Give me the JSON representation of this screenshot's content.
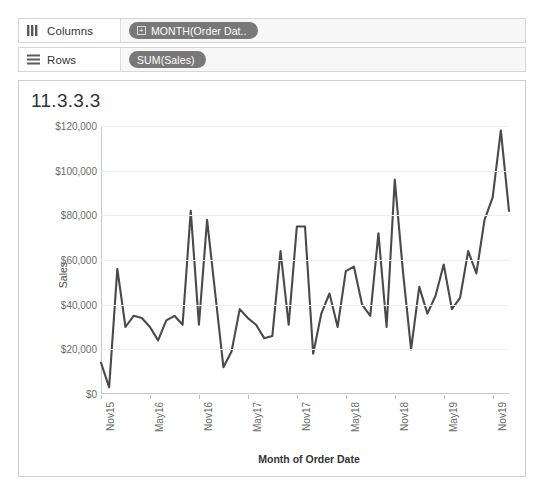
{
  "shelves": [
    {
      "name": "columns",
      "label": "Columns",
      "icon": "columns-icon",
      "pills": [
        {
          "label": "MONTH(Order Dat..",
          "expand": "+",
          "has_expand": true
        }
      ]
    },
    {
      "name": "rows",
      "label": "Rows",
      "icon": "rows-icon",
      "pills": [
        {
          "label": "SUM(Sales)",
          "expand": "",
          "has_expand": false
        }
      ]
    }
  ],
  "view": {
    "title": "11.3.3.3"
  },
  "colors": {
    "line": "#4a4a4a",
    "pill": "#787878",
    "grid": "#ededed",
    "axis": "#c8c8c8",
    "tick_text": "#6b6b6b",
    "panel_border": "#cfcfcf"
  },
  "chart_data": {
    "type": "line",
    "title": "11.3.3.3",
    "xlabel": "Month of Order Date",
    "ylabel": "Sales",
    "ylim": [
      0,
      120000
    ],
    "ytick_values": [
      0,
      20000,
      40000,
      60000,
      80000,
      100000,
      120000
    ],
    "ytick_labels": [
      "$0",
      "$20,000",
      "$40,000",
      "$60,000",
      "$80,000",
      "$100,000",
      "$120,000"
    ],
    "xtick_labels": [
      "Nov15",
      "May16",
      "Nov16",
      "May17",
      "Nov17",
      "May18",
      "Nov18",
      "May19",
      "Nov19"
    ],
    "xtick_indices": [
      0,
      6,
      12,
      18,
      24,
      30,
      36,
      42,
      48
    ],
    "grid": true,
    "legend": "none",
    "x": [
      "Nov15",
      "Dec15",
      "Jan16",
      "Feb16",
      "Mar16",
      "Apr16",
      "May16",
      "Jun16",
      "Jul16",
      "Aug16",
      "Sep16",
      "Oct16",
      "Nov16",
      "Dec16",
      "Jan17",
      "Feb17",
      "Mar17",
      "Apr17",
      "May17",
      "Jun17",
      "Jul17",
      "Aug17",
      "Sep17",
      "Oct17",
      "Nov17",
      "Dec17",
      "Jan18",
      "Feb18",
      "Mar18",
      "Apr18",
      "May18",
      "Jun18",
      "Jul18",
      "Aug18",
      "Sep18",
      "Oct18",
      "Nov18",
      "Dec18",
      "Jan19",
      "Feb19",
      "Mar19",
      "Apr19",
      "May19",
      "Jun19",
      "Jul19",
      "Aug19",
      "Sep19",
      "Oct19",
      "Nov19"
    ],
    "values": [
      14000,
      3000,
      56000,
      30000,
      35000,
      34000,
      30000,
      24000,
      33000,
      35000,
      31000,
      82000,
      31000,
      78000,
      45000,
      12000,
      19000,
      38000,
      34000,
      31000,
      25000,
      26000,
      64000,
      31000,
      75000,
      75000,
      18000,
      36000,
      45000,
      30000,
      55000,
      57000,
      40000,
      35000,
      72000,
      30000,
      96000,
      55000,
      20000,
      48000,
      36000,
      44000,
      58000,
      38000,
      43000,
      64000,
      54000,
      78000,
      88000
    ],
    "series": [
      {
        "name": "SUM(Sales)",
        "values": [
          14000,
          3000,
          56000,
          30000,
          35000,
          34000,
          30000,
          24000,
          33000,
          35000,
          31000,
          82000,
          31000,
          78000,
          45000,
          12000,
          19000,
          38000,
          34000,
          31000,
          25000,
          26000,
          64000,
          31000,
          75000,
          75000,
          18000,
          36000,
          45000,
          30000,
          55000,
          57000,
          40000,
          35000,
          72000,
          30000,
          96000,
          55000,
          20000,
          48000,
          36000,
          44000,
          58000,
          38000,
          43000,
          64000,
          54000,
          78000,
          88000
        ]
      }
    ],
    "extra_tail": {
      "note": "final segment peaks then drops",
      "values": [
        118000,
        82000
      ]
    }
  }
}
